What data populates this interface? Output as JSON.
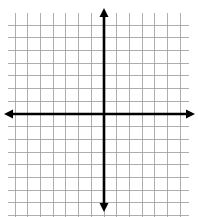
{
  "page": {
    "background_color": "#ffffff",
    "width": 198,
    "height": 217
  },
  "grid": {
    "label": "Grid",
    "line_color": "#9a9a9a",
    "line_width": 0.8,
    "cell_size": 12.7,
    "left": 8,
    "top": 13,
    "right": 189,
    "bottom": 217,
    "columns": 14,
    "rows": 16,
    "columns_left_of_axis": 7,
    "columns_right_of_axis": 7,
    "rows_above_axis": 8,
    "rows_below_axis": 8,
    "show_labels": false,
    "show_tick_numbers": false
  },
  "axes": {
    "label": "Coordinate axes",
    "color": "#000000",
    "line_width": 2.6,
    "origin_x": 104,
    "origin_y": 114,
    "x_axis": {
      "label": "x-axis",
      "left_end": 4,
      "right_end": 195,
      "arrow_left": true,
      "arrow_right": true,
      "axis_label_text": ""
    },
    "y_axis": {
      "label": "y-axis",
      "top_end": 8,
      "bottom_end": 212,
      "arrow_top": true,
      "arrow_bottom": true,
      "axis_label_text": ""
    },
    "arrow_head_length": 9,
    "arrow_head_width": 9
  },
  "chart_data": {
    "type": "scatter",
    "title": "",
    "subtitle": "",
    "xlabel": "",
    "ylabel": "",
    "xlim": [
      -7,
      7
    ],
    "ylim": [
      -8,
      8
    ],
    "xticks": [
      -7,
      -6,
      -5,
      -4,
      -3,
      -2,
      -1,
      0,
      1,
      2,
      3,
      4,
      5,
      6,
      7
    ],
    "yticks": [
      -8,
      -7,
      -6,
      -5,
      -4,
      -3,
      -2,
      -1,
      0,
      1,
      2,
      3,
      4,
      5,
      6,
      7,
      8
    ],
    "xticklabels": [],
    "yticklabels": [],
    "grid": true,
    "legend": null,
    "series": [],
    "annotations": []
  }
}
